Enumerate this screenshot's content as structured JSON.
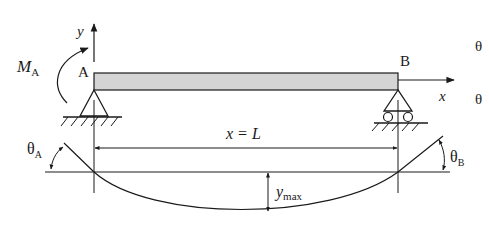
{
  "diagram": {
    "type": "simply-supported-beam-with-moment",
    "colors": {
      "line": "#1a1a1a",
      "beam_fill": "#d4d4d4",
      "background": "#ffffff"
    },
    "labels": {
      "y_axis": "y",
      "x_axis": "x",
      "moment_main": "M",
      "moment_sub": "A",
      "point_a": "A",
      "point_b": "B",
      "span_left": "x = ",
      "span_right": "L",
      "theta_a_main": "θ",
      "theta_a_sub": "A",
      "theta_b_main": "θ",
      "theta_b_sub": "B",
      "ymax_main": "y",
      "ymax_sub": "max",
      "edge_theta_top": "θ",
      "edge_theta_bottom": "θ"
    },
    "supports": [
      {
        "name": "A",
        "kind": "pin"
      },
      {
        "name": "B",
        "kind": "roller"
      }
    ]
  }
}
